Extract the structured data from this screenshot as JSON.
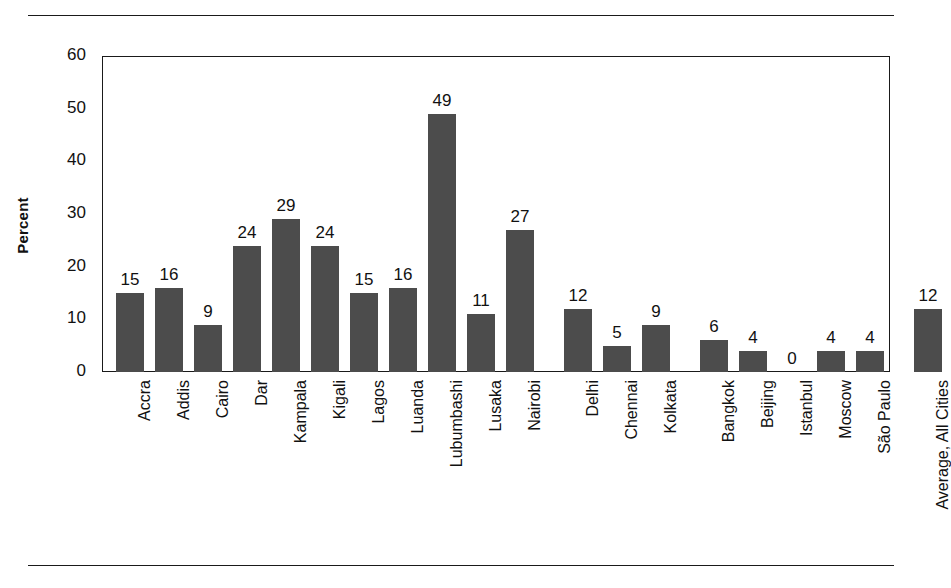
{
  "figure": {
    "has_top_rule": true,
    "has_bottom_rule": true,
    "bar_color": "#4c4c4c",
    "axis_color": "#1a1a1a",
    "background": "#ffffff"
  },
  "chart_data": {
    "type": "bar",
    "title": "",
    "subtitle": "",
    "xlabel": "",
    "ylabel": "Percent",
    "ylim": [
      0,
      60
    ],
    "yticks": [
      0,
      10,
      20,
      30,
      40,
      50,
      60
    ],
    "grid": false,
    "legend": null,
    "show_value_labels": true,
    "categories": [
      "Accra",
      "Addis",
      "Cairo",
      "Dar",
      "Kampala",
      "Kigali",
      "Lagos",
      "Luanda",
      "Lubumbashi",
      "Lusaka",
      "Nairobi",
      "Delhi",
      "Chennai",
      "Kolkata",
      "Bangkok",
      "Beijing",
      "Istanbul",
      "Moscow",
      "São Paulo",
      "Average, All Cities"
    ],
    "values": [
      15,
      16,
      9,
      24,
      29,
      24,
      15,
      16,
      49,
      11,
      27,
      12,
      5,
      9,
      6,
      4,
      0,
      4,
      4,
      12
    ],
    "groups": [
      {
        "name": "African cities",
        "start_index": 0,
        "end_index": 10
      },
      {
        "name": "Indian cities",
        "start_index": 11,
        "end_index": 13
      },
      {
        "name": "Other cities",
        "start_index": 14,
        "end_index": 18
      },
      {
        "name": "Average",
        "start_index": 19,
        "end_index": 19
      }
    ]
  }
}
